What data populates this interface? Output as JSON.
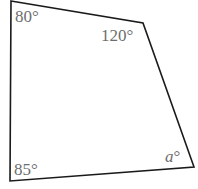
{
  "diagram": {
    "type": "quadrilateral",
    "stroke_color": "#1a1a1a",
    "label_color": "#6e6e6e",
    "vertices": [
      {
        "name": "top-left",
        "x": 11,
        "y": 1,
        "angle_label": "80°"
      },
      {
        "name": "top-right",
        "x": 143,
        "y": 23,
        "angle_label": "120°"
      },
      {
        "name": "bottom-right",
        "x": 194,
        "y": 167,
        "angle_label": "a°",
        "variable": "a",
        "degree": "°"
      },
      {
        "name": "bottom-left",
        "x": 10,
        "y": 181,
        "angle_label": "85°"
      }
    ]
  }
}
